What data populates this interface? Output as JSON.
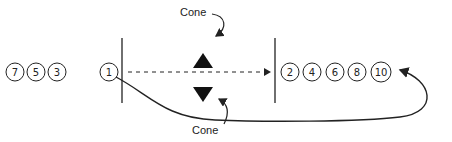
{
  "diagram": {
    "left_queue": [
      "7",
      "5",
      "3",
      "1"
    ],
    "right_queue": [
      "2",
      "4",
      "6",
      "8",
      "10"
    ],
    "cone_top_label": "Cone",
    "cone_bottom_label": "Cone",
    "colors": {
      "stroke": "#222222",
      "fill": "#111111",
      "background": "#ffffff"
    }
  }
}
